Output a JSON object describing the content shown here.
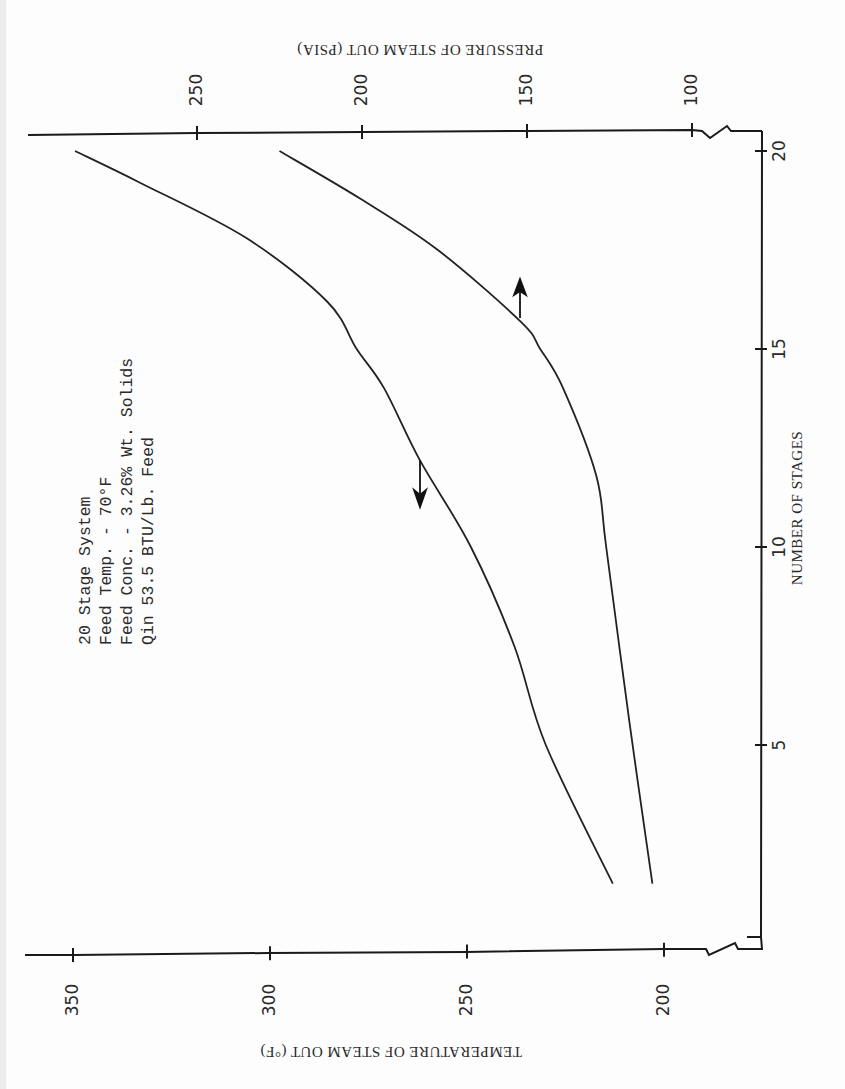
{
  "figure": {
    "orientation": "rotated 90 degrees clockwise (scanned page)",
    "annotation": {
      "lines": [
        "20 Stage System",
        "Feed Temp. - 70°F",
        "Feed Conc. - 3.26% Wt. Solids",
        "Qin  53.5 BTU/Lb. Feed"
      ]
    },
    "colors": {
      "ink": "#1a1a1a",
      "paper": "#fdfdfd"
    }
  },
  "chart_data": {
    "type": "line",
    "title": "",
    "xlabel": "NUMBER OF STAGES",
    "ylabel": "TEMPERATURE OF STEAM OUT (°F)",
    "y2label": "PRESSURE OF STEAM OUT (PSIA)",
    "x_ticks": [
      5,
      10,
      15,
      20
    ],
    "y_ticks": [
      200,
      250,
      300,
      350
    ],
    "y2_ticks": [
      100,
      150,
      200,
      250
    ],
    "xlim": [
      0.9,
      20.7
    ],
    "ylim": [
      180,
      355
    ],
    "y2lim": [
      90,
      270
    ],
    "grid": false,
    "legend": "none (curves identified by arrows pointing to their axis)",
    "series": [
      {
        "name": "Temperature of steam out",
        "axis": "left",
        "arrow": "points to temperature axis",
        "x": [
          1.5,
          5,
          7.5,
          10,
          12.2,
          14,
          15,
          16.2,
          17.8,
          19.2,
          20
        ],
        "values": [
          213,
          230,
          238,
          249,
          262,
          271,
          278,
          285.5,
          306,
          333,
          349.5
        ]
      },
      {
        "name": "Pressure of steam out",
        "axis": "right",
        "arrow": "points to pressure axis",
        "x": [
          1.5,
          5.6,
          10,
          11.8,
          14,
          15,
          15.7,
          17.5,
          18.8,
          20
        ],
        "values": [
          112,
          119,
          126,
          129,
          139,
          146,
          152,
          177,
          200.6,
          225
        ]
      }
    ]
  }
}
